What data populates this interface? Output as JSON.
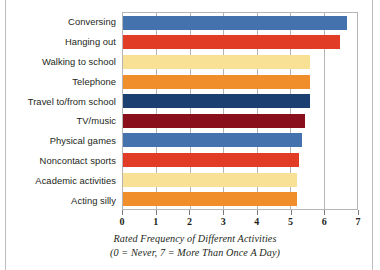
{
  "chart_data": {
    "type": "bar",
    "orientation": "horizontal",
    "title": "",
    "xlabel": "Rated Frequency of Different Activities",
    "xlabel_note": "(0 = Never,  7 = More Than Once A Day)",
    "ylabel": "",
    "xlim": [
      0,
      7
    ],
    "xticks": [
      "0",
      "1",
      "2",
      "3",
      "4",
      "5",
      "6",
      "7"
    ],
    "grid": true,
    "grid_axis": "x",
    "legend": "none",
    "categories": [
      "Conversing",
      "Hanging out",
      "Walking to school",
      "Telephone",
      "Travel to/from school",
      "TV/music",
      "Physical games",
      "Noncontact sports",
      "Academic activities",
      "Acting silly"
    ],
    "values": [
      6.7,
      6.5,
      5.6,
      5.6,
      5.6,
      5.45,
      5.35,
      5.25,
      5.2,
      5.2
    ],
    "colors": [
      "#4472ad",
      "#e03c26",
      "#f8e095",
      "#ef8e2b",
      "#1c3f72",
      "#8a0f1c",
      "#4472ad",
      "#e03c26",
      "#f8e095",
      "#ef8e2b"
    ]
  },
  "axis": {
    "grid_color": "#b5b5b5",
    "frame_color": "#b5b5b5",
    "tick_color": "#7a7a7a",
    "text_color": "#231f20"
  }
}
